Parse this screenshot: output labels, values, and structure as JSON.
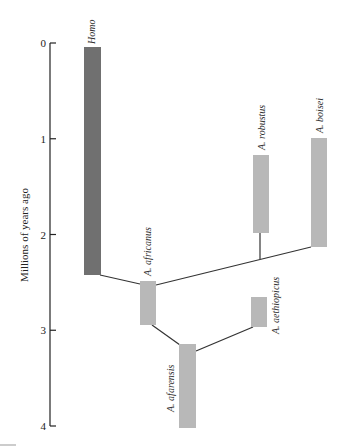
{
  "chart_data": {
    "type": "diagram",
    "title": "",
    "ylabel": "Millions of years ago",
    "yticks": [
      0,
      1,
      2,
      3,
      4
    ],
    "ylim": [
      0,
      4
    ],
    "colors": {
      "homo": "#707070",
      "australopith": "#b8b8b8",
      "line": "#333333",
      "axis": "#222222"
    },
    "taxa": [
      {
        "id": "homo",
        "label": "Homo",
        "start": 4.05,
        "x": 84,
        "top_mya": 0.04,
        "bottom_mya": 2.4,
        "dark": true
      },
      {
        "id": "africanus",
        "label": "A. africanus",
        "x": 140,
        "top_mya": 2.46,
        "bottom_mya": 2.92,
        "dark": false
      },
      {
        "id": "afarensis",
        "label": "A. afarensis",
        "x": 179,
        "top_mya": 3.12,
        "bottom_mya": 3.99,
        "dark": false
      },
      {
        "id": "aethiopicus",
        "label": "A. aethiopicus",
        "x": 251,
        "top_mya": 2.63,
        "bottom_mya": 2.94,
        "dark": false
      },
      {
        "id": "robustus",
        "label": "A. robustus",
        "x": 253,
        "top_mya": 1.16,
        "bottom_mya": 1.96,
        "dark": false
      },
      {
        "id": "boisei",
        "label": "A. boisei",
        "x": 311,
        "top_mya": 0.98,
        "bottom_mya": 2.11,
        "dark": false
      }
    ],
    "links": [
      {
        "from": "homo",
        "to": "africanus"
      },
      {
        "from": "africanus",
        "to": "boisei"
      },
      {
        "from": "africanus_to_boisei_branch",
        "to": "robustus"
      },
      {
        "from": "africanus",
        "to": "afarensis"
      },
      {
        "from": "afarensis",
        "to": "aethiopicus"
      }
    ]
  }
}
